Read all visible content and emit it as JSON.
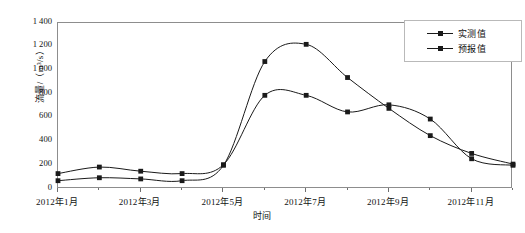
{
  "chart_data": {
    "type": "line",
    "title": "",
    "xlabel": "时间",
    "ylabel": "流量/（m³/s）",
    "ylim": [
      0,
      1400
    ],
    "ytick_values": [
      0,
      200,
      400,
      600,
      800,
      1000,
      1200,
      1400
    ],
    "ytick_labels": [
      "0",
      "200",
      "400",
      "600",
      "800",
      "1 000",
      "1 200",
      "1 400"
    ],
    "grid": false,
    "legend_position": "top-right",
    "x": [
      1,
      2,
      3,
      4,
      5,
      6,
      7,
      8,
      9,
      10,
      11,
      12
    ],
    "categories": [
      "2012年1月",
      "2012年2月",
      "2012年3月",
      "2012年4月",
      "2012年5月",
      "2012年6月",
      "2012年7月",
      "2012年8月",
      "2012年9月",
      "2012年10月",
      "2012年11月",
      "2012年12月"
    ],
    "xtick_labels": [
      "2012年1月",
      "2012年3月",
      "2012年5月",
      "2012年7月",
      "2012年9月",
      "2012年11月"
    ],
    "xtick_positions": [
      1,
      3,
      5,
      7,
      9,
      11
    ],
    "series": [
      {
        "name": "实测值",
        "color": "#1a1a1a",
        "marker": "square",
        "values": [
          130,
          185,
          150,
          130,
          205,
          790,
          790,
          650,
          710,
          590,
          255,
          200
        ]
      },
      {
        "name": "预报值",
        "color": "#1a1a1a",
        "marker": "square",
        "values": [
          70,
          95,
          85,
          70,
          200,
          1075,
          1220,
          940,
          680,
          450,
          300,
          210
        ]
      }
    ]
  },
  "legend": {
    "entries": [
      {
        "label": "实测值"
      },
      {
        "label": "预报值"
      }
    ]
  }
}
